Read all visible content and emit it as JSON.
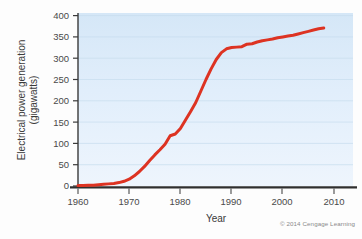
{
  "figure": {
    "credit": "© 2014 Cengage Learning",
    "background_color": "#fdfdfd",
    "plot_background_top": "#d7e8f7",
    "plot_background_bottom": "#eaf3fc",
    "line_color": "#dd3322",
    "axis_color": "#3a3a3a",
    "grid_color": "#c2d8ea"
  },
  "chart_data": {
    "type": "line",
    "title": "",
    "xlabel": "Year",
    "ylabel": "Electrical power generation (gigawatts)",
    "ylabel_line1": "Electrical power generation",
    "ylabel_line2": "(gigawatts)",
    "xlim": [
      1960,
      2011
    ],
    "ylim": [
      0,
      400
    ],
    "xticks": [
      1960,
      1970,
      1980,
      1990,
      2000,
      2010
    ],
    "xticklabels": [
      "1960",
      "1970",
      "1980",
      "1990",
      "2000",
      "2010"
    ],
    "yticks": [
      0,
      50,
      100,
      150,
      200,
      250,
      300,
      350,
      400
    ],
    "yticklabels": [
      "0",
      "50",
      "100",
      "150",
      "200",
      "250",
      "300",
      "350",
      "400"
    ],
    "grid": "horizontal",
    "legend": "none",
    "series": [
      {
        "name": "Electrical power generation",
        "color": "#dd3322",
        "x": [
          1960,
          1961,
          1962,
          1963,
          1964,
          1965,
          1966,
          1967,
          1968,
          1969,
          1970,
          1971,
          1972,
          1973,
          1974,
          1975,
          1976,
          1977,
          1978,
          1979,
          1980,
          1981,
          1982,
          1983,
          1984,
          1985,
          1986,
          1987,
          1988,
          1989,
          1990,
          1991,
          1992,
          1993,
          1994,
          1995,
          1996,
          1997,
          1998,
          1999,
          2000,
          2001,
          2002,
          2003,
          2004,
          2005,
          2006,
          2007,
          2008
        ],
        "y": [
          1,
          1,
          2,
          2,
          3,
          4,
          5,
          6,
          8,
          11,
          16,
          24,
          34,
          46,
          60,
          73,
          85,
          98,
          118,
          122,
          135,
          155,
          175,
          196,
          223,
          250,
          275,
          297,
          313,
          322,
          325,
          326,
          327,
          333,
          334,
          338,
          341,
          343,
          345,
          348,
          350,
          352,
          354,
          357,
          360,
          363,
          366,
          369,
          371
        ]
      }
    ]
  }
}
